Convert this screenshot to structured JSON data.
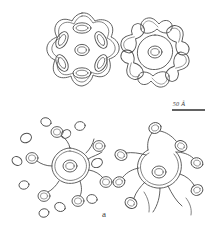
{
  "figure": {
    "panel_label": "a",
    "background_color": "#ffffff",
    "line_color": "#4f4f4f",
    "scale_bar": {
      "label": "50 Å",
      "value": 50,
      "unit": "Å",
      "x1": 172,
      "x2": 205,
      "y": 110
    },
    "panels": [
      {
        "id": "top-left",
        "name": "star-shaped-particle",
        "description": "Seven-lobed star outline with double contour enclosing six oval subunits around a central ring",
        "center": [
          82,
          57
        ],
        "lobes": 7,
        "subunit_count": 6,
        "subunit_shape": "oval",
        "has_central_ring": true
      },
      {
        "id": "top-right",
        "name": "rosette-particle",
        "description": "Six kidney-shaped subunits arranged around a hexagonal core with a central ring",
        "center": [
          155,
          57
        ],
        "lobes": 6,
        "subunit_count": 6,
        "subunit_shape": "kidney",
        "has_central_ring": true
      },
      {
        "id": "bottom-left",
        "name": "dissociating-particle",
        "description": "Polygonal core ring with wavy arms ending in small loops, surrounded by scattered free subunits",
        "center": [
          70,
          172
        ],
        "lobes": 6,
        "subunit_count": 7,
        "free_subunit_count": 10,
        "subunit_shape": "loop",
        "has_central_ring": true
      },
      {
        "id": "bottom-right",
        "name": "unravelled-particle",
        "description": "Open arc core with branching filaments terminating in looped subunits",
        "center": [
          158,
          172
        ],
        "lobes": 5,
        "subunit_count": 8,
        "subunit_shape": "loop",
        "has_central_ring": true
      }
    ]
  }
}
